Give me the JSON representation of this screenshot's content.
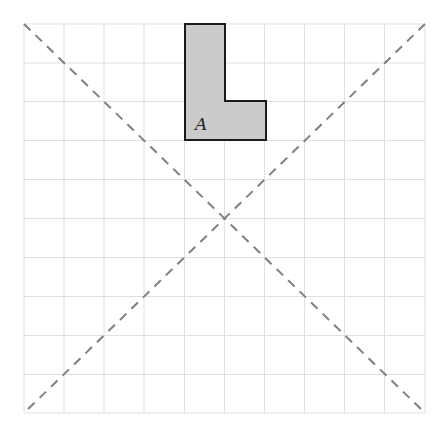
{
  "diagram": {
    "grid": {
      "cols": 10,
      "rows": 10,
      "left": 24,
      "top": 24,
      "right": 425,
      "bottom": 413,
      "line_color": "#e2e2e2"
    },
    "diagonals": {
      "color": "#808080",
      "style": "dashed"
    },
    "shape": {
      "label": "A",
      "fill": "#cdcdcd",
      "stroke": "#1a1a1a",
      "cells": "L-shape: column 5 rows 1-3, plus column 6 row 3"
    }
  }
}
